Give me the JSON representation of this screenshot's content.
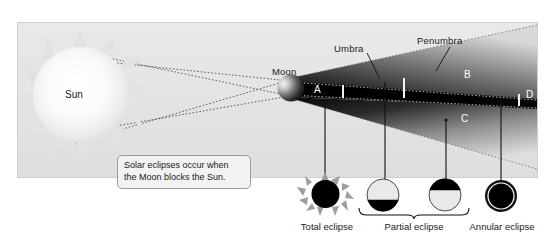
{
  "diagram": {
    "bodies": {
      "sun_label": "Sun",
      "moon_label": "Moon"
    },
    "shadow_regions": {
      "umbra_label": "Umbra",
      "penumbra_label": "Penumbra"
    },
    "position_markers": [
      {
        "id": "A",
        "label": "A"
      },
      {
        "id": "B",
        "label": "B"
      },
      {
        "id": "C",
        "label": "C"
      },
      {
        "id": "D",
        "label": "D"
      }
    ],
    "callout": {
      "line1": "Solar eclipses occur when",
      "line2": "the Moon blocks the Sun."
    },
    "colors": {
      "panel_bg": "#e5e5e5",
      "shadow_dark": "#000000",
      "sun_glow": "#ffffff",
      "callout_border": "#9a9aa5",
      "text": "#1a1a1a",
      "text_on_dark": "#ffffff"
    }
  },
  "eclipse_types": [
    {
      "id": "total",
      "label": "Total eclipse",
      "marker": "A",
      "icon": "total-eclipse-icon"
    },
    {
      "id": "partial1",
      "label": "",
      "marker": "B",
      "icon": "partial-eclipse-icon"
    },
    {
      "id": "partial2",
      "label": "",
      "marker": "C",
      "icon": "partial-eclipse-icon"
    },
    {
      "id": "annular",
      "label": "Annular eclipse",
      "marker": "D",
      "icon": "annular-eclipse-icon"
    }
  ],
  "bracket_label": "Partial eclipse"
}
